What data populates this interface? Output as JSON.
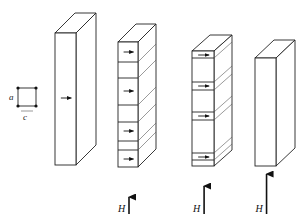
{
  "figure": {
    "unit_cell": {
      "label_vertical": "a",
      "label_horizontal": "c"
    },
    "stages": [
      {
        "id": "stage-1",
        "front": {
          "x": 55,
          "y": 33,
          "w": 21,
          "h": 132
        },
        "depth": {
          "dx": 20,
          "dy": -20
        },
        "dividers": [],
        "arrows_y": [
          98
        ],
        "field_label": "",
        "field_arrow_length": 0
      },
      {
        "id": "stage-2",
        "front": {
          "x": 118,
          "y": 42,
          "w": 20,
          "h": 125
        },
        "depth": {
          "dx": 18,
          "dy": -18
        },
        "dividers": [
          62,
          78,
          105,
          122,
          141,
          150
        ],
        "arrows_y": [
          52,
          91,
          131,
          159
        ],
        "field_label": "H",
        "field_arrow_length": 17
      },
      {
        "id": "stage-3",
        "front": {
          "x": 192,
          "y": 51,
          "w": 22,
          "h": 115
        },
        "depth": {
          "dx": 18,
          "dy": -16
        },
        "dividers": [
          58,
          82,
          90,
          112,
          120,
          153,
          160
        ],
        "arrows_y": [
          55,
          86,
          116,
          157
        ],
        "field_label": "H",
        "field_arrow_length": 28
      },
      {
        "id": "stage-4",
        "front": {
          "x": 255,
          "y": 58,
          "w": 21,
          "h": 108
        },
        "depth": {
          "dx": 19,
          "dy": -18
        },
        "dividers": [],
        "arrows_y": [],
        "field_label": "H",
        "field_arrow_length": 40
      }
    ],
    "field_arrow_bottom_y": 214
  }
}
